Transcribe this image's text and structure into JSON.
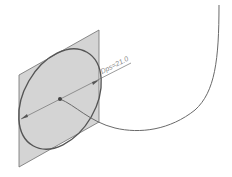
{
  "diagram": {
    "type": "cad-sweep-profile",
    "dimension_label": "Dps=21.0",
    "colors": {
      "plane_fill": "#d4d4d4",
      "plane_stroke": "#6e6e6e",
      "profile_stroke": "#555555",
      "path_stroke": "#6a6a6a",
      "dimension_stroke": "#707070",
      "label": "#8a8a8a"
    },
    "elements": {
      "sketch_plane": "parallelogram sketch plane",
      "profile": "circular profile (ellipse in perspective)",
      "center_point": "profile center point",
      "diameter_dimension": "diameter dimension line",
      "sweep_path": "curved sweep path"
    }
  }
}
